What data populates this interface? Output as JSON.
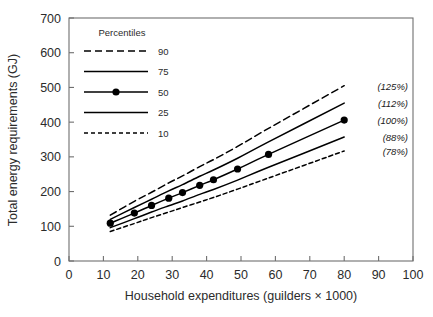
{
  "chart_data": {
    "type": "line",
    "title": "",
    "xlabel": "Household expenditures (guilders × 1000)",
    "ylabel": "Total energy requirements (GJ)",
    "xlim": [
      0,
      100
    ],
    "ylim": [
      0,
      700
    ],
    "xticks": [
      0,
      10,
      20,
      30,
      40,
      50,
      60,
      70,
      80,
      90,
      100
    ],
    "yticks": [
      0,
      100,
      200,
      300,
      400,
      500,
      600,
      700
    ],
    "grid": false,
    "legend_position": "upper-left-inside",
    "legend_title": "Percentiles",
    "x": [
      12,
      19,
      24,
      29,
      33,
      38,
      42,
      49,
      58,
      80
    ],
    "series": [
      {
        "name": "90",
        "label": "90",
        "style": "long-dash",
        "marker": false,
        "annotation": "(125%)",
        "values": [
          132,
          172,
          198,
          225,
          245,
          272,
          292,
          330,
          382,
          505
        ]
      },
      {
        "name": "75",
        "label": "75",
        "style": "solid",
        "marker": false,
        "annotation": "(112%)",
        "values": [
          120,
          154,
          178,
          202,
          220,
          244,
          262,
          296,
          343,
          455
        ]
      },
      {
        "name": "50",
        "label": "50",
        "style": "solid-marker",
        "marker": true,
        "annotation": "(100%)",
        "values": [
          109,
          138,
          160,
          181,
          197,
          218,
          234,
          265,
          307,
          406
        ]
      },
      {
        "name": "25",
        "label": "25",
        "style": "solid",
        "marker": false,
        "annotation": "(88%)",
        "values": [
          96,
          122,
          141,
          159,
          173,
          192,
          206,
          233,
          270,
          357
        ]
      },
      {
        "name": "10",
        "label": "10",
        "style": "short-dash",
        "marker": false,
        "annotation": "(78%)",
        "values": [
          85,
          108,
          125,
          141,
          154,
          170,
          183,
          207,
          239,
          317
        ]
      }
    ],
    "annotations": [
      "(125%)",
      "(112%)",
      "(100%)",
      "(88%)",
      "(78%)"
    ],
    "colors": {
      "line": "#000000",
      "axis": "#6f6f6f",
      "text": "#2b2b2b"
    }
  }
}
